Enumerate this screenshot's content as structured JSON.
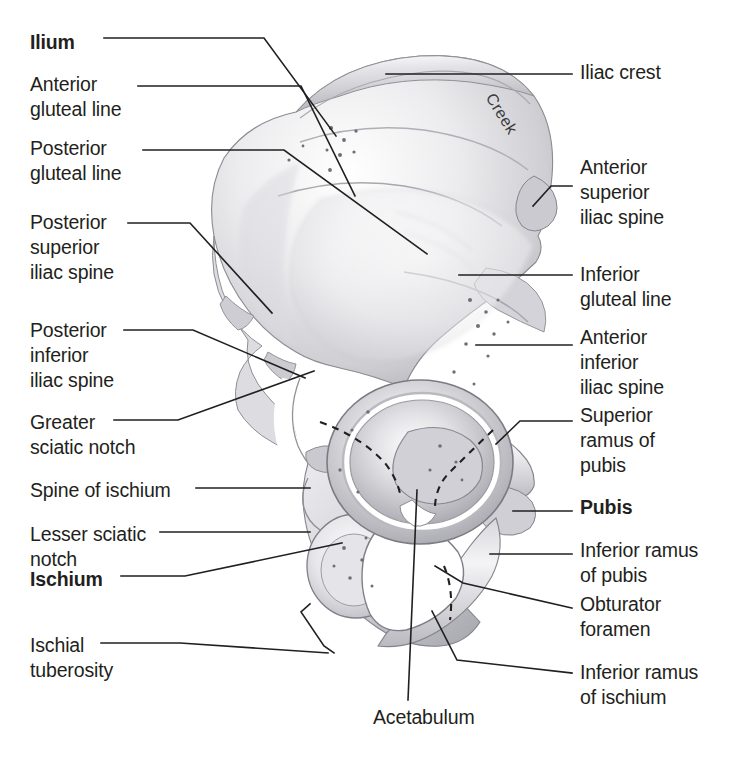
{
  "page": {
    "background_color": "#ffffff",
    "text_color": "#231f20",
    "width": 739,
    "height": 759,
    "top_clipped_text": " "
  },
  "artist_signature": "Creek",
  "labels_left": [
    {
      "id": "ilium",
      "text": "Ilium",
      "bold": true,
      "x": 30,
      "y": 30
    },
    {
      "id": "anterior-gluteal-line",
      "text": "Anterior\ngluteal line",
      "bold": false,
      "x": 30,
      "y": 72
    },
    {
      "id": "posterior-gluteal-line",
      "text": "Posterior\ngluteal line",
      "bold": false,
      "x": 30,
      "y": 136
    },
    {
      "id": "posterior-superior-iliac-spine",
      "text": "Posterior\nsuperior\niliac spine",
      "bold": false,
      "x": 30,
      "y": 210
    },
    {
      "id": "posterior-inferior-iliac-spine",
      "text": "Posterior\ninferior\niliac spine",
      "bold": false,
      "x": 30,
      "y": 318
    },
    {
      "id": "greater-sciatic-notch",
      "text": "Greater\nsciatic notch",
      "bold": false,
      "x": 30,
      "y": 410
    },
    {
      "id": "spine-of-ischium",
      "text": "Spine of ischium",
      "bold": false,
      "x": 30,
      "y": 478
    },
    {
      "id": "lesser-sciatic-notch",
      "text": "Lesser sciatic\nnotch",
      "bold": false,
      "x": 30,
      "y": 522
    },
    {
      "id": "ischium",
      "text": "Ischium",
      "bold": true,
      "x": 30,
      "y": 567
    },
    {
      "id": "ischial-tuberosity",
      "text": "Ischial\ntuberosity",
      "bold": false,
      "x": 30,
      "y": 633
    }
  ],
  "labels_right": [
    {
      "id": "iliac-crest",
      "text": "Iliac crest",
      "bold": false,
      "x": 580,
      "y": 60
    },
    {
      "id": "anterior-superior-iliac-spine",
      "text": "Anterior\nsuperior\niliac spine",
      "bold": false,
      "x": 580,
      "y": 155
    },
    {
      "id": "inferior-gluteal-line",
      "text": "Inferior\ngluteal line",
      "bold": false,
      "x": 580,
      "y": 262
    },
    {
      "id": "anterior-inferior-iliac-spine",
      "text": "Anterior\ninferior\niliac spine",
      "bold": false,
      "x": 580,
      "y": 325
    },
    {
      "id": "superior-ramus-of-pubis",
      "text": "Superior\nramus of\npubis",
      "bold": false,
      "x": 580,
      "y": 403
    },
    {
      "id": "pubis",
      "text": "Pubis",
      "bold": true,
      "x": 580,
      "y": 495
    },
    {
      "id": "inferior-ramus-of-pubis",
      "text": "Inferior ramus\nof pubis",
      "bold": false,
      "x": 580,
      "y": 538
    },
    {
      "id": "obturator-foramen",
      "text": "Obturator\nforamen",
      "bold": false,
      "x": 580,
      "y": 592
    },
    {
      "id": "inferior-ramus-of-ischium",
      "text": "Inferior ramus\nof ischium",
      "bold": false,
      "x": 580,
      "y": 660
    }
  ],
  "labels_bottom": [
    {
      "id": "acetabulum",
      "text": "Acetabulum",
      "bold": false,
      "x": 373,
      "y": 705
    }
  ],
  "leader_lines": {
    "stroke_color": "#231f20",
    "stroke_width": 1.6,
    "paths": [
      {
        "id": "leader-ilium",
        "d": "M 104 38  L 264 38  L 336 136"
      },
      {
        "id": "leader-anterior-gluteal-line",
        "d": "M 138 86  L 301 86  L 355 196"
      },
      {
        "id": "leader-posterior-gluteal-line",
        "d": "M 143 150 L 284 150 L 427 254"
      },
      {
        "id": "leader-posterior-superior-iliac-spine",
        "d": "M 128 223 L 190 223 L 272 313"
      },
      {
        "id": "leader-posterior-inferior-iliac-spine",
        "d": "M 124 330 L 193 330 L 305 378"
      },
      {
        "id": "leader-greater-sciatic-notch",
        "d": "M 114 420 L 178 420 L 314 371"
      },
      {
        "id": "leader-spine-of-ischium",
        "d": "M 196 488 L 310 488"
      },
      {
        "id": "leader-lesser-sciatic-notch",
        "d": "M 160 532 L 310 532"
      },
      {
        "id": "leader-ischium",
        "d": "M 121 576 L 185 576 L 342 543"
      },
      {
        "id": "leader-ischial-tuberosity",
        "d": "M 101 643 L 180 643 L 328 653"
      },
      {
        "id": "leader-ischial-bracket",
        "d": "M 310 604 L 301 612 L 324 646 L 334 653"
      },
      {
        "id": "leader-iliac-crest",
        "d": "M 386 74  L 572 74"
      },
      {
        "id": "leader-anterior-superior-iliac-spine",
        "d": "M 533 206 L 551 186 L 572 186"
      },
      {
        "id": "leader-inferior-gluteal-line",
        "d": "M 459 275 L 572 275"
      },
      {
        "id": "leader-anterior-inferior-iliac-spine",
        "d": "M 476 345 L 572 345"
      },
      {
        "id": "leader-superior-ramus-of-pubis",
        "d": "M 496 444 L 520 421 L 572 421"
      },
      {
        "id": "leader-pubis",
        "d": "M 513 511 L 572 511"
      },
      {
        "id": "leader-inferior-ramus-of-pubis",
        "d": "M 490 554 L 572 554"
      },
      {
        "id": "leader-obturator-foramen",
        "d": "M 435 566 L 463 583 L 572 608"
      },
      {
        "id": "leader-inferior-ramus-of-ischium",
        "d": "M 432 611 L 457 660 L 572 673"
      },
      {
        "id": "leader-acetabulum",
        "d": "M 417 490 L 408 700"
      }
    ]
  },
  "acetabulum_division_lines": {
    "stroke_color": "#231f20",
    "dash": "7 6",
    "paths": [
      {
        "id": "dash-ilium-ischium-boundary",
        "d": "M 320 422 Q 360 436 385 463 Q 398 480 401 498"
      },
      {
        "id": "dash-ilium-pubis-boundary",
        "d": "M 493 430 Q 470 452 448 474 Q 436 487 435 506"
      },
      {
        "id": "dash-pubis-ischium-boundary",
        "d": "M 444 566 Q 454 590 450 620"
      }
    ]
  },
  "illustration": {
    "name": "hip-bone-lateral-view",
    "description": "Lateral (external) view of the right hip bone showing ilium, ischium and pubis",
    "fill_light": "#fbfbfb",
    "fill_mid": "#d9d9dc",
    "fill_shadow": "#a9a9ae",
    "outline": "#7d7d84"
  }
}
